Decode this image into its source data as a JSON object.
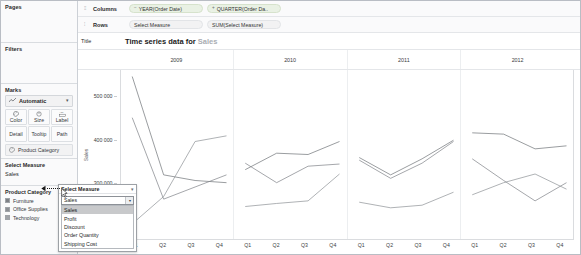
{
  "sidebar": {
    "shelves": [
      {
        "name": "Pages",
        "label": "Pages"
      },
      {
        "name": "Filters",
        "label": "Filters"
      }
    ],
    "marks": {
      "title": "Marks",
      "type_label": "Automatic",
      "type_icon": "line-chart-icon",
      "caret": "▾",
      "buttons": [
        {
          "label": "Color",
          "icon": "color-palette-icon"
        },
        {
          "label": "Size",
          "icon": "size-circle-icon"
        },
        {
          "label": "Label",
          "icon": "label-tag-icon"
        },
        {
          "label": "Detail",
          "icon": "detail-icon"
        },
        {
          "label": "Tooltip",
          "icon": "tooltip-icon"
        },
        {
          "label": "Path",
          "icon": "path-icon"
        }
      ],
      "pill": {
        "label": "Product Category",
        "icon": "color-palette-icon"
      }
    },
    "parameter": {
      "title": "Select Measure",
      "value": "Sales"
    },
    "legend": {
      "title": "Product Category",
      "items": [
        {
          "label": "Furniture",
          "color": "#7d8085"
        },
        {
          "label": "Office Supplies",
          "color": "#8c8f94"
        },
        {
          "label": "Technology",
          "color": "#a0a3a8"
        }
      ]
    }
  },
  "shelves": {
    "columns": {
      "icon": "columns-icon",
      "label": "Columns",
      "pills": [
        {
          "label": "YEAR(Order Date)",
          "icon": "−"
        },
        {
          "label": "QUARTER(Order Da..",
          "icon": "+"
        }
      ]
    },
    "rows": {
      "icon": "rows-icon",
      "label": "Rows",
      "pills": [
        {
          "label": "Select Measure",
          "icon": ""
        },
        {
          "label": "SUM(Select Measure)",
          "icon": ""
        }
      ]
    },
    "title": {
      "label": "Title",
      "text_prefix": "Time series data for ",
      "measure": "Sales"
    }
  },
  "popup": {
    "title": "Select Measure",
    "caret": "▾",
    "selected": "Sales",
    "combo_caret": "▾",
    "options": [
      "Sales",
      "Profit",
      "Discount",
      "Order Quantity",
      "Shipping Cost"
    ]
  },
  "chart_data": {
    "type": "line",
    "title": "Time series data for Sales",
    "xlabel": "",
    "ylabel": "Sales",
    "ylim": [
      170000,
      560000
    ],
    "yticks": [
      200000,
      300000,
      400000,
      500000
    ],
    "ytick_labels": [
      "200 000",
      "300 000",
      "400 000",
      "500 000"
    ],
    "grid": false,
    "legend_position": "sidebar",
    "panel_titles": [
      "2009",
      "2010",
      "2011",
      "2012"
    ],
    "x_categories": [
      "Q1",
      "Q2",
      "Q3",
      "Q4"
    ],
    "series": [
      {
        "name": "Furniture",
        "color": "#6f7277",
        "panels": {
          "2009": [
            545000,
            318000,
            305000,
            300000
          ],
          "2010": [
            330000,
            368000,
            365000,
            395000
          ],
          "2011": [
            358000,
            318000,
            355000,
            398000
          ],
          "2012": [
            415000,
            412000,
            378000,
            385000
          ]
        }
      },
      {
        "name": "Office Supplies",
        "color": "#7e8186",
        "panels": {
          "2009": [
            450000,
            262000,
            290000,
            318000
          ],
          "2010": [
            345000,
            300000,
            338000,
            343000
          ],
          "2011": [
            352000,
            310000,
            345000,
            395000
          ],
          "2012": [
            355000,
            305000,
            258000,
            300000
          ]
        }
      },
      {
        "name": "Technology",
        "color": "#8d9095",
        "panels": {
          "2009": [
            205000,
            268000,
            395000,
            408000
          ],
          "2010": [
            245000,
            252000,
            258000,
            320000
          ],
          "2011": [
            255000,
            242000,
            248000,
            278000
          ],
          "2012": [
            272000,
            300000,
            320000,
            285000
          ]
        }
      }
    ]
  }
}
